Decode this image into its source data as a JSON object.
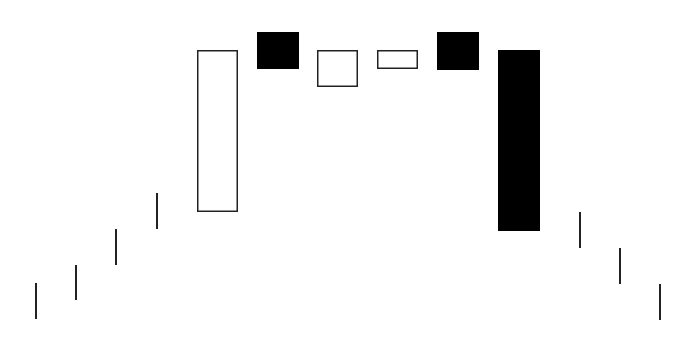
{
  "chart_data": {
    "type": "candlestick",
    "title": "",
    "xlabel": "",
    "ylabel": "",
    "grid": false,
    "legend": null,
    "colors": {
      "bullish_fill": "#ffffff",
      "bearish_fill": "#000000",
      "outline": "#222222"
    },
    "candles": [
      {
        "index": 1,
        "kind": "line",
        "x": 36,
        "top": 283,
        "bottom": 319
      },
      {
        "index": 2,
        "kind": "line",
        "x": 76,
        "top": 265,
        "bottom": 300
      },
      {
        "index": 3,
        "kind": "line",
        "x": 116,
        "top": 229,
        "bottom": 265
      },
      {
        "index": 4,
        "kind": "line",
        "x": 157,
        "top": 193,
        "bottom": 229
      },
      {
        "index": 5,
        "kind": "bullish",
        "x": 197,
        "w": 41,
        "top": 50,
        "bottom": 212
      },
      {
        "index": 6,
        "kind": "bearish",
        "x": 257,
        "w": 42,
        "top": 32,
        "bottom": 69
      },
      {
        "index": 7,
        "kind": "bullish",
        "x": 317,
        "w": 41,
        "top": 50,
        "bottom": 87
      },
      {
        "index": 8,
        "kind": "bullish",
        "x": 377,
        "w": 41,
        "top": 50,
        "bottom": 69
      },
      {
        "index": 9,
        "kind": "bearish",
        "x": 437,
        "w": 42,
        "top": 32,
        "bottom": 70
      },
      {
        "index": 10,
        "kind": "bearish",
        "x": 498,
        "w": 42,
        "top": 50,
        "bottom": 231
      },
      {
        "index": 11,
        "kind": "line",
        "x": 580,
        "top": 212,
        "bottom": 248
      },
      {
        "index": 12,
        "kind": "line",
        "x": 620,
        "top": 248,
        "bottom": 284
      },
      {
        "index": 13,
        "kind": "line",
        "x": 660,
        "top": 284,
        "bottom": 320
      }
    ]
  }
}
